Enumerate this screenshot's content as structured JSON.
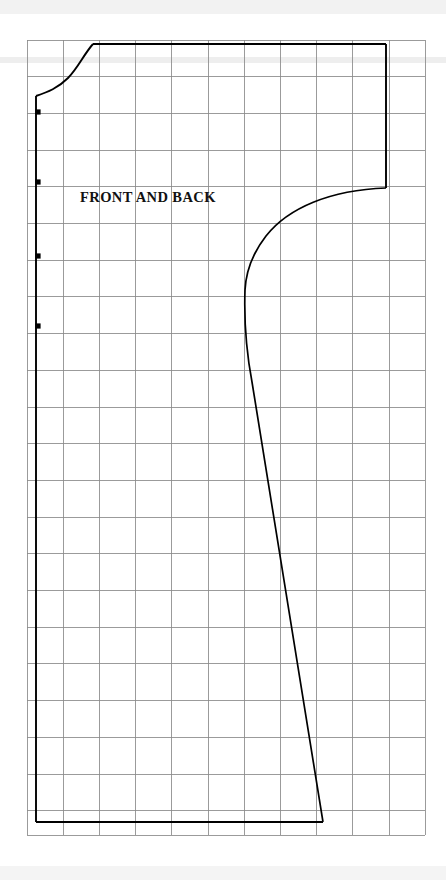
{
  "document": {
    "type": "sewing-pattern-diagram",
    "title": "FRONT AND BACK",
    "background_color": "#ffffff"
  },
  "labels": {
    "piece_name": "FRONT AND BACK"
  },
  "colors": {
    "grid_line": "#8a8a8a",
    "grid_line_light": "#b9b9b9",
    "outline": "#000000",
    "dot": "#000000",
    "scan_artifact": "#ededed",
    "paper": "#ffffff"
  },
  "chart_data": {
    "type": "scatter",
    "title": "FRONT AND BACK",
    "xlabel": "",
    "ylabel": "",
    "grid": true,
    "legend_position": "none",
    "grid_spec": {
      "origin_x": 27,
      "origin_y": 40,
      "cell_width": 36.2,
      "cell_height": 36.7,
      "columns": 11,
      "rows": 21.7,
      "right_edge": 425,
      "bottom_edge": 835,
      "x_lines": [
        27,
        63.2,
        99.4,
        135.6,
        171.8,
        208,
        244.2,
        280.4,
        316.6,
        352.8,
        389,
        425
      ],
      "y_lines": [
        40,
        76.7,
        113.4,
        150.1,
        186.8,
        223.5,
        260.2,
        296.9,
        333.6,
        370.3,
        407,
        443.7,
        480.4,
        517.1,
        553.8,
        590.5,
        627.2,
        663.9,
        700.6,
        737.3,
        774,
        810.7,
        835
      ]
    },
    "outline_path": "M 36 96 L 36 822 L 323 822 L 245 290 L 386 188 L 386 44 L 93 44 Z",
    "vertices": [
      {
        "name": "neckline-fold-point",
        "x": 36,
        "y": 96
      },
      {
        "name": "shoulder-neck-point",
        "x": 93,
        "y": 44
      },
      {
        "name": "sleeve-top-outer",
        "x": 386,
        "y": 44
      },
      {
        "name": "sleeve-hem-outer",
        "x": 386,
        "y": 188
      },
      {
        "name": "underarm-point",
        "x": 245,
        "y": 290
      },
      {
        "name": "side-seam-hem",
        "x": 323,
        "y": 822
      },
      {
        "name": "hem-fold-corner",
        "x": 36,
        "y": 822
      }
    ],
    "notch_dots": [
      {
        "x": 38,
        "y": 112,
        "r": 2.6
      },
      {
        "x": 38,
        "y": 182,
        "r": 2.6
      },
      {
        "x": 38,
        "y": 256,
        "r": 2.6
      },
      {
        "x": 38,
        "y": 326,
        "r": 2.6
      }
    ],
    "annotations": [
      {
        "text": "FRONT AND BACK",
        "x": 80,
        "y": 203,
        "bold": true
      }
    ]
  },
  "geometry": {
    "neckline_curve": "M 36 96 C 48 92 58 88 68 78 C 78 68 84 54 93 44",
    "armhole_curve": "M 386 188 C 330 190 288 208 266 236 C 252 254 246 272 245 290",
    "side_seam": "M 245 290 C 244 320 246 350 252 382 L 323 822",
    "fold_edge": "M 36 96 L 36 822",
    "hem_edge": "M 36 822 L 323 822",
    "shoulder_edge": "M 93 44 L 386 44",
    "sleeve_edge": "M 386 44 L 386 188"
  }
}
